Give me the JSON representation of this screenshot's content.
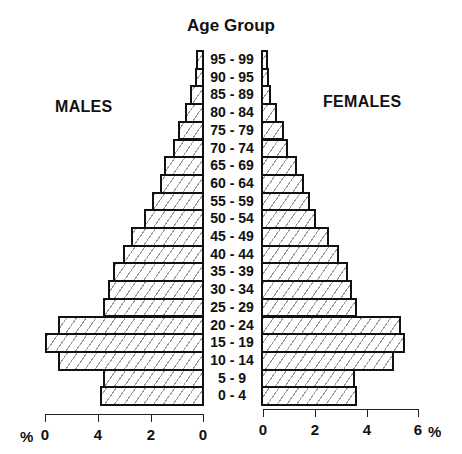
{
  "chart_data": {
    "type": "bar",
    "subtype": "population-pyramid",
    "title": "Age Group",
    "left_label": "MALES",
    "right_label": "FEMALES",
    "categories": [
      "95 - 99",
      "90 - 95",
      "85 - 89",
      "80 - 84",
      "75 - 79",
      "70 - 74",
      "65 - 69",
      "60 - 64",
      "55 - 59",
      "50 - 54",
      "45 - 49",
      "40 - 44",
      "35 - 39",
      "30 - 34",
      "25 - 29",
      "20 - 24",
      "15 - 19",
      "10 - 14",
      "5 - 9",
      "0 - 4"
    ],
    "series": [
      {
        "name": "MALES",
        "side": "left",
        "values": [
          0.3,
          0.35,
          0.55,
          0.75,
          1.0,
          1.2,
          1.55,
          1.7,
          2.0,
          2.3,
          2.8,
          3.1,
          3.5,
          3.7,
          3.9,
          5.6,
          6.1,
          5.6,
          3.9,
          4.0
        ]
      },
      {
        "name": "FEMALES",
        "side": "right",
        "values": [
          0.25,
          0.3,
          0.4,
          0.6,
          0.9,
          1.05,
          1.4,
          1.65,
          1.9,
          2.1,
          2.6,
          3.0,
          3.35,
          3.5,
          3.7,
          5.4,
          5.55,
          5.1,
          3.6,
          3.7
        ]
      }
    ],
    "xlabel": "%",
    "left_axis": {
      "ticks": [
        6,
        4,
        2,
        0
      ],
      "tick_labels": [
        "0",
        "4",
        "2",
        "0"
      ],
      "unit_label": "%"
    },
    "right_axis": {
      "ticks": [
        0,
        2,
        4,
        6
      ],
      "tick_labels": [
        "0",
        "2",
        "4",
        "6"
      ],
      "unit_label": "%"
    },
    "xlim": [
      0,
      6
    ],
    "grid": false,
    "legend": null,
    "fill": "diagonal-hatch"
  },
  "colors": {
    "bar_border": "#111111",
    "hatch": "#9a9a9a",
    "background": "#ffffff",
    "text": "#111111"
  }
}
